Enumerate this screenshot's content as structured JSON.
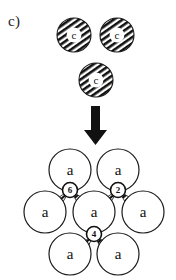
{
  "figure": {
    "panel_label": "c)",
    "background_color": "#ffffff",
    "stroke_color": "#1a1a1a",
    "hatch_color": "#111111",
    "fill_color": "#ffffff",
    "width": 176,
    "height": 280
  },
  "reactant_group": {
    "description": "three hatched circles labelled c",
    "node_label": "c",
    "style": "diagonal-hatched",
    "nodes": [
      {
        "id": "c-top-left",
        "label": "c",
        "cx": 74,
        "cy": 35,
        "r": 17
      },
      {
        "id": "c-top-right",
        "label": "c",
        "cx": 117,
        "cy": 35,
        "r": 17
      },
      {
        "id": "c-bottom",
        "label": "c",
        "cx": 96,
        "cy": 80,
        "r": 17
      }
    ]
  },
  "arrow": {
    "name": "downward-reaction-arrow",
    "direction": "down",
    "x": 95,
    "y_start": 106,
    "y_end": 142
  },
  "product_cluster": {
    "description": "seven open circles labelled a connected by hatched bonds with numbered junction nodes",
    "node_label": "a",
    "style": "open-outline",
    "nodes": [
      {
        "id": "a-top-left",
        "label": "a",
        "cx": 70,
        "cy": 170,
        "r": 21
      },
      {
        "id": "a-top-right",
        "label": "a",
        "cx": 118,
        "cy": 170,
        "r": 21
      },
      {
        "id": "a-mid-left",
        "label": "a",
        "cx": 45,
        "cy": 212,
        "r": 21
      },
      {
        "id": "a-center",
        "label": "a",
        "cx": 94,
        "cy": 212,
        "r": 21
      },
      {
        "id": "a-mid-right",
        "label": "a",
        "cx": 143,
        "cy": 212,
        "r": 21
      },
      {
        "id": "a-bottom-left",
        "label": "a",
        "cx": 70,
        "cy": 254,
        "r": 21
      },
      {
        "id": "a-bottom-right",
        "label": "a",
        "cx": 118,
        "cy": 254,
        "r": 21
      }
    ],
    "junctions": [
      {
        "id": "junction-6",
        "label": "6",
        "cx": 70,
        "cy": 190,
        "r": 7.5
      },
      {
        "id": "junction-2",
        "label": "2",
        "cx": 118,
        "cy": 190,
        "r": 7.5
      },
      {
        "id": "junction-4",
        "label": "4",
        "cx": 94,
        "cy": 234,
        "r": 7.5
      }
    ]
  }
}
